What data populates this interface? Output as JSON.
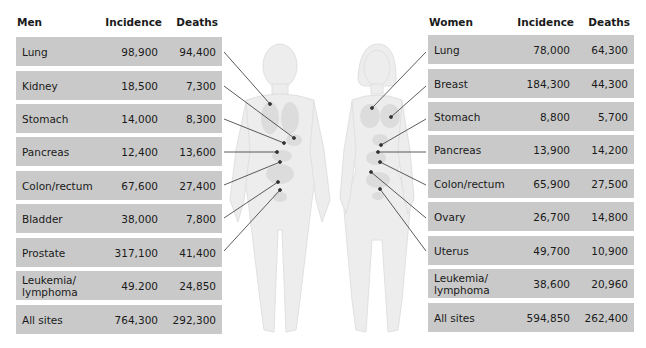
{
  "men": {
    "headers": {
      "site": "Men",
      "incidence": "Incidence",
      "deaths": "Deaths"
    },
    "rows": [
      {
        "site": "Lung",
        "incidence": "98,900",
        "deaths": "94,400"
      },
      {
        "site": "Kidney",
        "incidence": "18,500",
        "deaths": "7,300"
      },
      {
        "site": "Stomach",
        "incidence": "14,000",
        "deaths": "8,300"
      },
      {
        "site": "Pancreas",
        "incidence": "12,400",
        "deaths": "13,600"
      },
      {
        "site": "Colon/rectum",
        "incidence": "67,600",
        "deaths": "27,400"
      },
      {
        "site": "Bladder",
        "incidence": "38,000",
        "deaths": "7,800"
      },
      {
        "site": "Prostate",
        "incidence": "317,100",
        "deaths": "41,400"
      },
      {
        "site": "Leukemia/ lymphoma",
        "incidence": "49.200",
        "deaths": "24,850"
      },
      {
        "site": "All sites",
        "incidence": "764,300",
        "deaths": "292,300"
      }
    ]
  },
  "women": {
    "headers": {
      "site": "Women",
      "incidence": "Incidence",
      "deaths": "Deaths"
    },
    "rows": [
      {
        "site": "Lung",
        "incidence": "78,000",
        "deaths": "64,300"
      },
      {
        "site": "Breast",
        "incidence": "184,300",
        "deaths": "44,300"
      },
      {
        "site": "Stomach",
        "incidence": "8,800",
        "deaths": "5,700"
      },
      {
        "site": "Pancreas",
        "incidence": "13,900",
        "deaths": "14,200"
      },
      {
        "site": "Colon/rectum",
        "incidence": "65,900",
        "deaths": "27,500"
      },
      {
        "site": "Ovary",
        "incidence": "26,700",
        "deaths": "14,800"
      },
      {
        "site": "Uterus",
        "incidence": "49,700",
        "deaths": "10,900"
      },
      {
        "site": "Leukemia/ lymphoma",
        "incidence": "38,600",
        "deaths": "20,960"
      },
      {
        "site": "All sites",
        "incidence": "594,850",
        "deaths": "262,400"
      }
    ]
  },
  "figures": {
    "male_figure": "male-body-illustration",
    "female_figure": "female-body-illustration",
    "colors": {
      "row_bg": "#c9c9c9",
      "figure": "#ececec",
      "organ": "#dedede",
      "leader_line": "#333333"
    }
  }
}
